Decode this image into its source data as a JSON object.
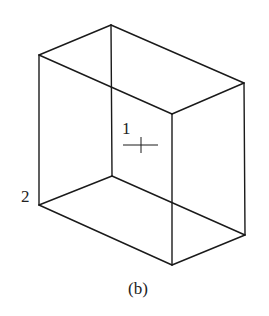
{
  "figure": {
    "caption": "(b)",
    "labels": [
      {
        "id": "point-1",
        "text": "1"
      },
      {
        "id": "point-2",
        "text": "2"
      }
    ],
    "shape": "rectangular box (wireframe, isometric view)",
    "vertices": {
      "top_back": [
        111,
        25
      ],
      "top_left": [
        39,
        55
      ],
      "top_right": [
        244,
        83
      ],
      "top_front": [
        172,
        114
      ],
      "bottom_back": [
        112,
        176
      ],
      "bottom_left": [
        39,
        205
      ],
      "bottom_right": [
        245,
        235
      ],
      "bottom_front": [
        172,
        265
      ]
    },
    "line_color": "#1a1a1a"
  }
}
